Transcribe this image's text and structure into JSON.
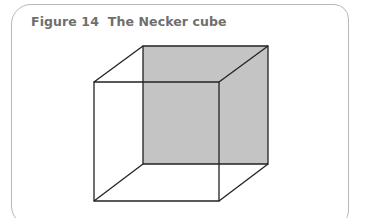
{
  "figure": {
    "caption": "Figure 14  The Necker cube",
    "colors": {
      "frame_border": "#b8b8b8",
      "caption_text": "#6e6e6e",
      "edge_stroke": "#222222",
      "shaded_face": "#c4c4c4"
    },
    "cube": {
      "front_face": {
        "top_left": [
          94,
          82
        ],
        "top_right": [
          219,
          82
        ],
        "bottom_right": [
          219,
          201
        ],
        "bottom_left": [
          94,
          201
        ]
      },
      "back_face": {
        "top_left": [
          143,
          46
        ],
        "top_right": [
          268,
          46
        ],
        "bottom_right": [
          268,
          164
        ],
        "bottom_left": [
          143,
          164
        ]
      },
      "shaded": "back_face"
    }
  }
}
